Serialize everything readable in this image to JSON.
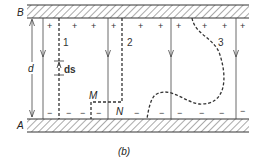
{
  "figure": {
    "caption": "(b)",
    "plates": {
      "top": {
        "label": "B",
        "charge_sign": "+"
      },
      "bottom": {
        "label": "A",
        "charge_sign": "−"
      }
    },
    "separation_label": "d",
    "element_label": "ds",
    "points": {
      "M": "M",
      "N": "N"
    },
    "paths": [
      {
        "id": "1",
        "label": "1",
        "style": "dashed",
        "shape": "straight"
      },
      {
        "id": "2",
        "label": "2",
        "style": "dashed",
        "shape": "stepped via M, N"
      },
      {
        "id": "3",
        "label": "3",
        "style": "dashed",
        "shape": "curved"
      }
    ],
    "field_lines": {
      "count": 4,
      "direction": "down"
    },
    "colors": {
      "ink": "#333333",
      "hatch": "#555555",
      "background": "#ffffff"
    }
  }
}
